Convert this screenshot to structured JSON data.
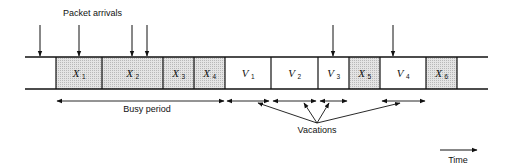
{
  "diagram": {
    "title_label": "Packet arrivals",
    "busy_label": "Busy period",
    "vacations_label": "Vacations",
    "time_label": "Time",
    "colors": {
      "line": "#111111",
      "shaded_fill": "#d9d9d9",
      "plain_fill": "#ffffff"
    },
    "timeline": {
      "x_start": 25,
      "x_end": 488,
      "y_top": 57,
      "y_bottom": 89
    },
    "boxes": [
      {
        "id": "X1",
        "base": "X",
        "sub": "1",
        "x0": 56,
        "x1": 102,
        "shaded": true
      },
      {
        "id": "X2",
        "base": "X",
        "sub": "2",
        "x0": 102,
        "x1": 163,
        "shaded": true
      },
      {
        "id": "X3",
        "base": "X",
        "sub": "3",
        "x0": 163,
        "x1": 194,
        "shaded": true
      },
      {
        "id": "X4",
        "base": "X",
        "sub": "4",
        "x0": 194,
        "x1": 225,
        "shaded": true
      },
      {
        "id": "V1",
        "base": "V",
        "sub": "1",
        "x0": 225,
        "x1": 271,
        "shaded": false
      },
      {
        "id": "V2",
        "base": "V",
        "sub": "2",
        "x0": 271,
        "x1": 318,
        "shaded": false
      },
      {
        "id": "V3",
        "base": "V",
        "sub": "3",
        "x0": 318,
        "x1": 349,
        "shaded": false
      },
      {
        "id": "X5",
        "base": "X",
        "sub": "5",
        "x0": 349,
        "x1": 380,
        "shaded": true
      },
      {
        "id": "V4",
        "base": "V",
        "sub": "4",
        "x0": 380,
        "x1": 426,
        "shaded": false
      },
      {
        "id": "X6",
        "base": "X",
        "sub": "6",
        "x0": 426,
        "x1": 457,
        "shaded": true
      }
    ],
    "arrivals_x": [
      40,
      79,
      132,
      147,
      333,
      393
    ],
    "busy_span": {
      "x0": 57,
      "x1": 224,
      "y": 101
    },
    "vacation_spans": [
      {
        "x0": 227,
        "x1": 269
      },
      {
        "x0": 273,
        "x1": 316
      },
      {
        "x0": 320,
        "x1": 347
      },
      {
        "x0": 382,
        "x1": 425
      }
    ],
    "vacation_pointer_origin": {
      "x": 317,
      "y": 123
    },
    "vacation_pointer_targets": [
      {
        "x": 258,
        "y": 103
      },
      {
        "x": 304,
        "y": 103
      },
      {
        "x": 329,
        "y": 103
      },
      {
        "x": 400,
        "y": 103
      }
    ]
  }
}
